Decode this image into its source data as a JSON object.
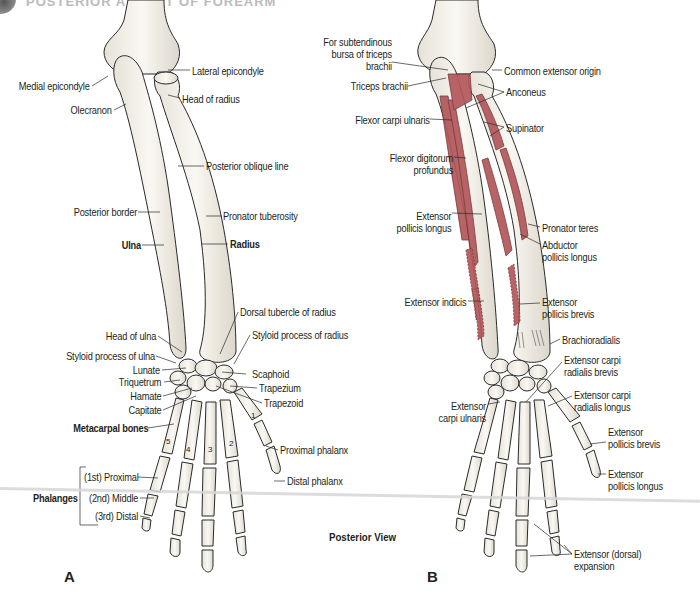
{
  "header": {
    "title": "POSTERIOR ASPECT OF FOREARM",
    "title_visibility": "cut-off"
  },
  "view_label": "Posterior View",
  "colors": {
    "bone_fill": "#f4f1ea",
    "bone_outline": "#2a2a2a",
    "muscle_fill": "#b3565a",
    "muscle_outline": "#6b2e30",
    "label_text": "#231f20"
  },
  "panel_a": {
    "letter": "A",
    "labels": {
      "medial_epicondyle": "Medial epicondyle",
      "lateral_epicondyle": "Lateral epicondyle",
      "head_of_radius": "Head of radius",
      "olecranon": "Olecranon",
      "posterior_oblique_line": "Posterior oblique line",
      "posterior_border": "Posterior border",
      "pronator_tuberosity": "Pronator tuberosity",
      "ulna": "Ulna",
      "radius": "Radius",
      "dorsal_tubercle": "Dorsal tubercle of radius",
      "head_of_ulna": "Head of ulna",
      "styloid_radius": "Styloid process of radius",
      "styloid_ulna": "Styloid process of ulna",
      "lunate": "Lunate",
      "scaphoid": "Scaphoid",
      "triquetrum": "Triquetrum",
      "trapezium": "Trapezium",
      "hamate": "Hamate",
      "trapezoid": "Trapezoid",
      "capitate": "Capitate",
      "metacarpal_bones": "Metacarpal bones",
      "proximal_phalanx": "Proximal phalanx",
      "distal_phalanx": "Distal phalanx",
      "phalanges": "Phalanges",
      "phalanx_1st": "(1st) Proximal",
      "phalanx_2nd": "(2nd) Middle",
      "phalanx_3rd": "(3rd) Distal"
    },
    "metacarpal_numbers": [
      "1",
      "2",
      "3",
      "4",
      "5"
    ]
  },
  "panel_b": {
    "letter": "B",
    "labels": {
      "subtendinous_bursa": "For subtendinous\nbursa of triceps\nbrachii",
      "common_extensor_origin": "Common extensor origin",
      "triceps_brachii": "Triceps brachii",
      "anconeus": "Anconeus",
      "flexor_carpi_ulnaris": "Flexor carpi ulnaris",
      "supinator": "Supinator",
      "flexor_digitorum_profundus": "Flexor digitorum\nprofundus",
      "extensor_pollicis_longus_forearm": "Extensor\npollicis longus",
      "pronator_teres": "Pronator teres",
      "abductor_pollicis_longus": "Abductor\npollicis longus",
      "extensor_indicis": "Extensor indicis",
      "extensor_pollicis_brevis_forearm": "Extensor\npollicis brevis",
      "brachioradialis": "Brachioradialis",
      "ecr_brevis": "Extensor carpi\nradialis brevis",
      "ecr_longus": "Extensor carpi\nradialis longus",
      "extensor_carpi_ulnaris": "Extensor\ncarpi ulnaris",
      "extensor_pollicis_brevis_hand": "Extensor\npollicis brevis",
      "extensor_pollicis_longus_hand": "Extensor\npollicis longus",
      "extensor_expansion": "Extensor (dorsal)\nexpansion"
    }
  }
}
